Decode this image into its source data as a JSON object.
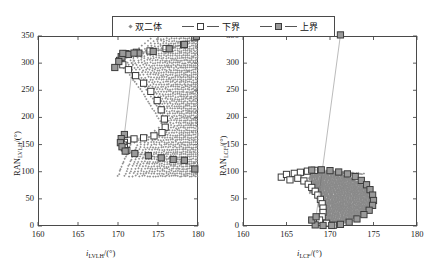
{
  "figure": {
    "background": "#ffffff",
    "axis_color": "#4a4a4a",
    "marker_fill_color": "#9a9a9a",
    "marker_edge_color": "#3c3c3c",
    "scatter_color": "#8a8a8a"
  },
  "legend": {
    "position": "top-center",
    "entries": [
      {
        "label": "双二体",
        "marker": "diamond-dot",
        "name": "legend-entry-scatter"
      },
      {
        "label": "下界",
        "marker": "open-square-line",
        "name": "legend-entry-lower-bound"
      },
      {
        "label": "上界",
        "marker": "filled-square-line",
        "name": "legend-entry-upper-bound"
      }
    ]
  },
  "chart_data": [
    {
      "type": "scatter",
      "name": "left-panel",
      "title": "",
      "xlabel": "i_LVLH/(°)",
      "ylabel": "RAN_LVLH/(°)",
      "xlabel_parts": {
        "italic": "i",
        "sub": "LVLH",
        "unit": "/(°)"
      },
      "ylabel_parts": {
        "roman": "RAN",
        "sub": "LVLH",
        "unit": "/(°)"
      },
      "xlim": [
        160,
        180
      ],
      "ylim": [
        0,
        350
      ],
      "xticks": [
        160,
        165,
        170,
        175,
        180
      ],
      "yticks": [
        0,
        50,
        100,
        150,
        200,
        250,
        300,
        350
      ],
      "grid": false,
      "series": [
        {
          "name": "下界",
          "marker": "open-square",
          "points": [
            [
              179.6,
              347.0
            ],
            [
              178.2,
              334.0
            ],
            [
              176.0,
              327.0
            ],
            [
              174.0,
              322.5
            ],
            [
              172.3,
              320.0
            ],
            [
              171.0,
              317.5
            ],
            [
              170.4,
              312.0
            ],
            [
              170.2,
              305.0
            ],
            [
              170.6,
              297.0
            ],
            [
              171.3,
              288.0
            ],
            [
              172.2,
              277.0
            ],
            [
              173.2,
              263.0
            ],
            [
              174.1,
              248.0
            ],
            [
              174.9,
              231.0
            ],
            [
              175.4,
              214.0
            ],
            [
              175.8,
              197.0
            ],
            [
              175.9,
              182.0
            ],
            [
              175.5,
              172.0
            ],
            [
              174.5,
              166.0
            ],
            [
              173.2,
              162.5
            ],
            [
              172.0,
              160.5
            ],
            [
              171.2,
              158.0
            ],
            [
              170.8,
              154.0
            ],
            [
              170.7,
              149.0
            ],
            [
              170.8,
              144.0
            ],
            [
              171.1,
              139.0
            ]
          ]
        },
        {
          "name": "上界",
          "marker": "filled-square",
          "points": [
            [
              179.8,
              349.5
            ],
            [
              178.3,
              334.5
            ],
            [
              176.4,
              326.5
            ],
            [
              174.4,
              321.5
            ],
            [
              172.6,
              318.5
            ],
            [
              171.3,
              316.0
            ],
            [
              170.5,
              311.0
            ],
            [
              170.1,
              303.0
            ],
            [
              169.6,
              292.0
            ],
            [
              170.6,
              318.0
            ],
            [
              172.0,
              318.5
            ],
            [
              170.8,
              168.5
            ],
            [
              170.4,
              161.0
            ],
            [
              170.3,
              153.5
            ],
            [
              170.5,
              146.0
            ],
            [
              170.9,
              138.0
            ],
            [
              172.1,
              133.5
            ],
            [
              173.8,
              129.5
            ],
            [
              175.4,
              125.5
            ],
            [
              176.9,
              122.5
            ],
            [
              178.3,
              121.0
            ],
            [
              179.6,
              105.0
            ]
          ]
        },
        {
          "name": "双二体",
          "marker": "diamond-dot",
          "description": "dense radial scatter cloud filling region between bounds, concentrated toward x=180",
          "x_range": [
            170.0,
            180.0
          ],
          "y_range": [
            88,
            345
          ],
          "point_count": 520
        }
      ]
    },
    {
      "type": "scatter",
      "name": "right-panel",
      "title": "",
      "xlabel": "i_LCF/(°)",
      "ylabel": "RAN_LCF/(°)",
      "xlabel_parts": {
        "italic": "i",
        "sub": "LCF",
        "unit": "/(°)"
      },
      "ylabel_parts": {
        "roman": "RAN",
        "sub": "LCF",
        "unit": "/(°)"
      },
      "xlim": [
        160,
        180
      ],
      "ylim": [
        0,
        350
      ],
      "xticks": [
        160,
        165,
        170,
        175,
        180
      ],
      "yticks": [
        0,
        50,
        100,
        150,
        200,
        250,
        300,
        350
      ],
      "grid": false,
      "series": [
        {
          "name": "下界",
          "marker": "open-square",
          "points": [
            [
              164.4,
              90.0
            ],
            [
              165.0,
              95.0
            ],
            [
              165.4,
              85.0
            ],
            [
              165.9,
              97.0
            ],
            [
              166.6,
              99.0
            ],
            [
              167.4,
              101.0
            ],
            [
              168.2,
              102.5
            ],
            [
              166.3,
              88.0
            ],
            [
              167.0,
              83.0
            ],
            [
              167.5,
              77.0
            ],
            [
              167.9,
              71.0
            ],
            [
              168.3,
              64.0
            ],
            [
              168.6,
              57.0
            ],
            [
              168.9,
              49.0
            ],
            [
              169.1,
              41.0
            ],
            [
              169.2,
              33.0
            ],
            [
              169.2,
              25.0
            ],
            [
              169.1,
              17.0
            ],
            [
              168.8,
              11.0
            ],
            [
              169.6,
              5.0
            ],
            [
              170.4,
              1.5
            ]
          ]
        },
        {
          "name": "上界",
          "marker": "filled-square",
          "points": [
            [
              167.9,
              103.0
            ],
            [
              169.0,
              103.5
            ],
            [
              170.0,
              102.0
            ],
            [
              171.0,
              99.5
            ],
            [
              172.0,
              96.0
            ],
            [
              172.9,
              91.0
            ],
            [
              173.6,
              84.0
            ],
            [
              174.2,
              76.0
            ],
            [
              174.6,
              67.0
            ],
            [
              174.9,
              57.0
            ],
            [
              175.0,
              47.0
            ],
            [
              174.9,
              38.0
            ],
            [
              174.5,
              29.0
            ],
            [
              173.9,
              21.0
            ],
            [
              173.1,
              13.0
            ],
            [
              172.2,
              7.0
            ],
            [
              171.2,
              3.0
            ],
            [
              170.2,
              1.0
            ],
            [
              169.2,
              1.0
            ],
            [
              168.3,
              2.0
            ],
            [
              167.9,
              11.0
            ],
            [
              168.4,
              17.0
            ],
            [
              171.2,
              352.0
            ]
          ]
        },
        {
          "name": "双二体",
          "marker": "diamond-dot",
          "description": "dense filled crescent cloud between the bound curves",
          "x_range": [
            167.5,
            175.0
          ],
          "y_range": [
            0,
            103
          ],
          "point_count": 420
        }
      ]
    }
  ]
}
